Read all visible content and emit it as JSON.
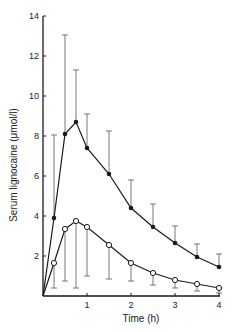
{
  "chart_data": {
    "type": "line",
    "title": "",
    "xlabel": "Time (h)",
    "ylabel": "Serum lignocaine (μmol/l)",
    "xlim": [
      0,
      4
    ],
    "ylim": [
      0,
      14
    ],
    "grid": false,
    "legend": "none",
    "x_ticks": [
      1,
      2,
      3,
      4
    ],
    "y_ticks": [
      2,
      4,
      6,
      8,
      10,
      12,
      14
    ],
    "series": [
      {
        "name": "filled circles",
        "marker": "filled-circle",
        "error_direction": "up",
        "x": [
          0,
          0.25,
          0.5,
          0.75,
          1,
          1.5,
          2,
          2.5,
          3,
          3.5,
          4
        ],
        "values": [
          0,
          3.9,
          8.1,
          8.7,
          7.4,
          6.1,
          4.4,
          3.45,
          2.65,
          1.95,
          1.45
        ],
        "error_upper": [
          null,
          8.05,
          13.05,
          11.3,
          9.1,
          8.25,
          5.8,
          4.6,
          3.5,
          2.6,
          2.1
        ]
      },
      {
        "name": "open circles",
        "marker": "open-circle",
        "error_direction": "down",
        "x": [
          0,
          0.25,
          0.5,
          0.75,
          1,
          1.5,
          2,
          2.5,
          3,
          3.5,
          4
        ],
        "values": [
          0,
          1.65,
          3.35,
          3.75,
          3.45,
          2.55,
          1.65,
          1.15,
          0.8,
          0.6,
          0.4
        ],
        "error_lower": [
          null,
          0.4,
          0.75,
          0.4,
          1.0,
          0.85,
          0.75,
          0.55,
          0.4,
          0.25,
          0.15
        ]
      }
    ]
  }
}
